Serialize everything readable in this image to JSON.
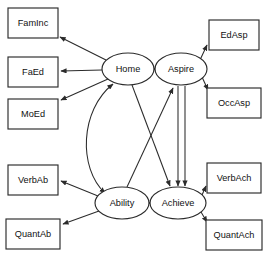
{
  "diagram": {
    "type": "path-diagram",
    "title": "",
    "background_color": "#ffffff",
    "stroke_color": "#2b2b2b",
    "text_color": "#111111",
    "observed_nodes": [
      {
        "id": "FamInc",
        "label": "FamInc",
        "shape": "rect",
        "x": 8,
        "y": 8,
        "w": 50,
        "h": 30
      },
      {
        "id": "FaEd",
        "label": "FaEd",
        "shape": "rect",
        "x": 8,
        "y": 57,
        "w": 50,
        "h": 30
      },
      {
        "id": "MoEd",
        "label": "MoEd",
        "shape": "rect",
        "x": 8,
        "y": 99,
        "w": 50,
        "h": 30
      },
      {
        "id": "VerbAb",
        "label": "VerbAb",
        "shape": "rect",
        "x": 8,
        "y": 165,
        "w": 50,
        "h": 30
      },
      {
        "id": "QuantAb",
        "label": "QuantAb",
        "shape": "rect",
        "x": 6,
        "y": 219,
        "w": 54,
        "h": 30
      },
      {
        "id": "EdAsp",
        "label": "EdAsp",
        "shape": "rect",
        "x": 209,
        "y": 20,
        "w": 50,
        "h": 30
      },
      {
        "id": "OccAsp",
        "label": "OccAsp",
        "shape": "rect",
        "x": 207,
        "y": 88,
        "w": 54,
        "h": 30
      },
      {
        "id": "VerbAch",
        "label": "VerbAch",
        "shape": "rect",
        "x": 207,
        "y": 163,
        "w": 54,
        "h": 30
      },
      {
        "id": "QuantAch",
        "label": "QuantAch",
        "shape": "rect",
        "x": 206,
        "y": 220,
        "w": 56,
        "h": 30
      }
    ],
    "latent_nodes": [
      {
        "id": "Home",
        "label": "Home",
        "shape": "ellipse",
        "cx": 128,
        "cy": 69,
        "rx": 26,
        "ry": 16
      },
      {
        "id": "Aspire",
        "label": "Aspire",
        "shape": "ellipse",
        "cx": 181,
        "cy": 69,
        "rx": 26,
        "ry": 16
      },
      {
        "id": "Ability",
        "label": "Ability",
        "shape": "ellipse",
        "cx": 122,
        "cy": 203,
        "rx": 27,
        "ry": 16
      },
      {
        "id": "Achieve",
        "label": "Achieve",
        "shape": "ellipse",
        "cx": 178,
        "cy": 203,
        "rx": 28,
        "ry": 16
      }
    ],
    "edges": [
      {
        "from": "Home",
        "to": "FamInc",
        "style": "straight",
        "arrows": "single"
      },
      {
        "from": "Home",
        "to": "FaEd",
        "style": "straight",
        "arrows": "single"
      },
      {
        "from": "Home",
        "to": "MoEd",
        "style": "straight",
        "arrows": "single"
      },
      {
        "from": "Aspire",
        "to": "EdAsp",
        "style": "straight",
        "arrows": "single"
      },
      {
        "from": "Aspire",
        "to": "OccAsp",
        "style": "straight",
        "arrows": "single"
      },
      {
        "from": "Ability",
        "to": "VerbAb",
        "style": "straight",
        "arrows": "single"
      },
      {
        "from": "Ability",
        "to": "QuantAb",
        "style": "straight",
        "arrows": "single"
      },
      {
        "from": "Achieve",
        "to": "VerbAch",
        "style": "straight",
        "arrows": "single"
      },
      {
        "from": "Achieve",
        "to": "QuantAch",
        "style": "straight",
        "arrows": "single"
      },
      {
        "from": "Home",
        "to": "Aspire",
        "style": "straight",
        "arrows": "single"
      },
      {
        "from": "Ability",
        "to": "Achieve",
        "style": "straight",
        "arrows": "single"
      },
      {
        "from": "Ability",
        "to": "Aspire",
        "style": "straight",
        "arrows": "single"
      },
      {
        "from": "Home",
        "to": "Achieve",
        "style": "straight",
        "arrows": "single"
      },
      {
        "from": "Aspire",
        "to": "Achieve",
        "style": "double-line",
        "arrows": "single"
      },
      {
        "from": "Home",
        "to": "Ability",
        "style": "curved",
        "arrows": "double"
      }
    ]
  }
}
